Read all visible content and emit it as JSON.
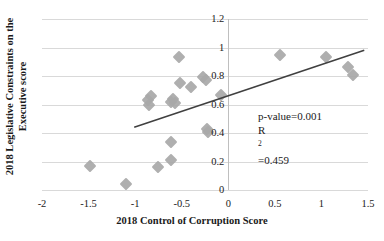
{
  "chart_data": {
    "type": "scatter",
    "title": "",
    "xlabel": "2018 Control of Corruption Score",
    "ylabel_line1": "2018 Legislative Constraints on the",
    "ylabel_line2": "Executive score",
    "xlim": [
      -2,
      1.5
    ],
    "ylim": [
      0,
      1.2
    ],
    "xticks": [
      "-2",
      "-1.5",
      "-1",
      "-0.5",
      "0",
      "0.5",
      "1",
      "1.5"
    ],
    "xtick_values": [
      -2,
      -1.5,
      -1,
      -0.5,
      0,
      0.5,
      1,
      1.5
    ],
    "yticks": [
      "0",
      "0.2",
      "0.4",
      "0.6",
      "0.8",
      "1",
      "1.2"
    ],
    "ytick_values": [
      0,
      0.2,
      0.4,
      0.6,
      0.8,
      1,
      1.2
    ],
    "grid": "horizontal",
    "legend": "none",
    "marker": "diamond",
    "marker_color": "#a8a8a8",
    "line_color": "#404040",
    "gridline_color": "#d9d9d9",
    "points": [
      {
        "x": -1.49,
        "y": 0.17
      },
      {
        "x": -1.1,
        "y": 0.04
      },
      {
        "x": -0.86,
        "y": 0.63
      },
      {
        "x": -0.85,
        "y": 0.6
      },
      {
        "x": -0.83,
        "y": 0.66
      },
      {
        "x": -0.75,
        "y": 0.16
      },
      {
        "x": -0.62,
        "y": 0.62
      },
      {
        "x": -0.61,
        "y": 0.21
      },
      {
        "x": -0.61,
        "y": 0.34
      },
      {
        "x": -0.59,
        "y": 0.64
      },
      {
        "x": -0.57,
        "y": 0.61
      },
      {
        "x": -0.53,
        "y": 0.93
      },
      {
        "x": -0.52,
        "y": 0.75
      },
      {
        "x": -0.4,
        "y": 0.72
      },
      {
        "x": -0.27,
        "y": 0.79
      },
      {
        "x": -0.24,
        "y": 0.77
      },
      {
        "x": -0.23,
        "y": 0.43
      },
      {
        "x": -0.22,
        "y": 0.41
      },
      {
        "x": -0.08,
        "y": 0.67
      },
      {
        "x": 0.56,
        "y": 0.95
      },
      {
        "x": 1.05,
        "y": 0.93
      },
      {
        "x": 1.29,
        "y": 0.86
      },
      {
        "x": 1.34,
        "y": 0.81
      }
    ],
    "trendline": {
      "x_start": -1.01,
      "y_start": 0.44,
      "x_end": 1.46,
      "y_end": 0.98
    },
    "annotations": {
      "p_value": "p-value=0.001",
      "r_squared_prefix": "R",
      "r_squared_sup": "2",
      "r_squared_value": "=0.459"
    }
  }
}
